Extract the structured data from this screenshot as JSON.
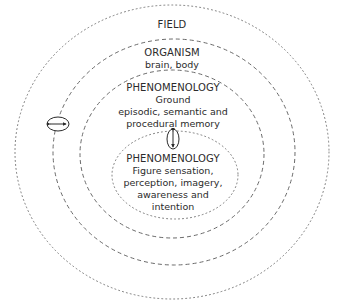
{
  "diagram": {
    "type": "nested-concentric-ellipses",
    "stroke_color": "#6e6e6e",
    "levels": [
      {
        "id": "field",
        "title": "FIELD",
        "lines": [],
        "border_style": "dotted"
      },
      {
        "id": "organism",
        "title": "ORGANISM",
        "lines": [
          "brain, body"
        ],
        "border_style": "dashed"
      },
      {
        "id": "phenomenology-ground",
        "title": "PHENOMENOLOGY",
        "lines": [
          "Ground",
          "episodic, semantic and",
          "procedural memory"
        ],
        "border_style": "dashed"
      },
      {
        "id": "phenomenology-figure",
        "title": "PHENOMENOLOGY",
        "lines": [
          "Figure sensation,",
          "perception, imagery,",
          "awareness and",
          "intention"
        ],
        "border_style": "dotted"
      }
    ],
    "connectors": [
      {
        "id": "field-organism-exchange",
        "orientation": "horizontal",
        "icon": "double-arrow-horizontal"
      },
      {
        "id": "ground-figure-exchange",
        "orientation": "vertical",
        "icon": "double-arrow-vertical"
      }
    ]
  }
}
